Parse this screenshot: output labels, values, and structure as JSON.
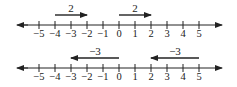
{
  "diagram": {
    "type": "number-line-addition",
    "number_lines": [
      {
        "id": "top",
        "ticks": [
          "−5",
          "−4",
          "−3",
          "−2",
          "−1",
          "0",
          "1",
          "2",
          "3",
          "4",
          "5"
        ],
        "arrows": [
          {
            "label": "2",
            "from": -4,
            "to": -2,
            "direction": "right"
          },
          {
            "label": "2",
            "from": 0,
            "to": 2,
            "direction": "right"
          }
        ]
      },
      {
        "id": "bottom",
        "ticks": [
          "−5",
          "−4",
          "−3",
          "−2",
          "−1",
          "0",
          "1",
          "2",
          "3",
          "4",
          "5"
        ],
        "arrows": [
          {
            "label": "−3",
            "from": 0,
            "to": -3,
            "direction": "left"
          },
          {
            "label": "−3",
            "from": 5,
            "to": 2,
            "direction": "left"
          }
        ]
      }
    ],
    "colors": {
      "ink": "#222222",
      "background": "#ffffff"
    }
  }
}
